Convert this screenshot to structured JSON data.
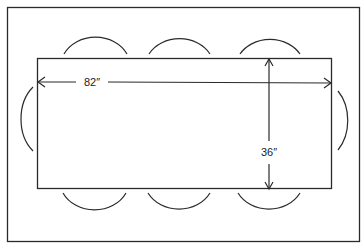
{
  "diagram": {
    "table": {
      "length_label": "82″",
      "width_label": "36″",
      "length_inches": 82,
      "width_inches": 36
    },
    "chairs": {
      "top": 3,
      "bottom": 3,
      "left": 1,
      "right": 1
    },
    "colors": {
      "line": "#2a2a2a",
      "background": "#ffffff"
    }
  }
}
